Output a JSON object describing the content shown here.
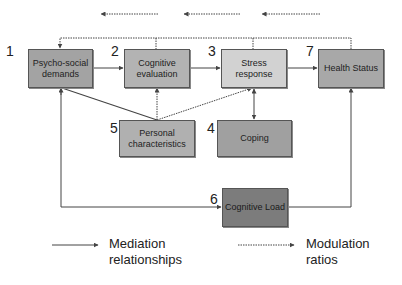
{
  "diagram": {
    "nodes": [
      {
        "id": "1",
        "number": "1",
        "label": "Psycho-social demands",
        "color": "#a3a3a3"
      },
      {
        "id": "2",
        "number": "2",
        "label": "Cognitive evaluation",
        "color": "#b3b3b3"
      },
      {
        "id": "3",
        "number": "3",
        "label": "Stress response",
        "color": "#d2d2d2"
      },
      {
        "id": "7",
        "number": "7",
        "label": "Health Status",
        "color": "#a8a8a8"
      },
      {
        "id": "5",
        "number": "5",
        "label": "Personal characteristics",
        "color": "#b0b0b0"
      },
      {
        "id": "4",
        "number": "4",
        "label": "Coping",
        "color": "#a0a0a0"
      },
      {
        "id": "6",
        "number": "6",
        "label": "Cognitive Load",
        "color": "#7c7c7c"
      }
    ],
    "edges": [
      {
        "from": "1",
        "to": "2",
        "type": "mediation"
      },
      {
        "from": "2",
        "to": "3",
        "type": "mediation"
      },
      {
        "from": "3",
        "to": "7",
        "type": "mediation"
      },
      {
        "from": "5",
        "to": "1",
        "type": "mediation"
      },
      {
        "from": "5",
        "to": "2",
        "type": "modulation"
      },
      {
        "from": "5",
        "to": "3",
        "type": "modulation"
      },
      {
        "from": "3",
        "to": "4",
        "type": "mediation",
        "bidirectional": true
      },
      {
        "from": "1",
        "to": "6",
        "type": "mediation",
        "bidirectional": true
      },
      {
        "from": "6",
        "to": "7",
        "type": "mediation"
      },
      {
        "from": "7",
        "to": "1",
        "type": "modulation",
        "route": "top-feedback"
      }
    ],
    "top_arrows_direction": "left",
    "legend": {
      "mediation_line1": "Mediation",
      "mediation_line2": "relationships",
      "modulation_line1": "Modulation",
      "modulation_line2": "ratios"
    }
  }
}
